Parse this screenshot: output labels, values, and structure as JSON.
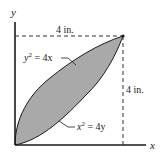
{
  "diagram": {
    "axes": {
      "x_label": "x",
      "y_label": "y"
    },
    "dimensions": {
      "horizontal": "4 in.",
      "vertical": "4 in."
    },
    "curves": {
      "upper": {
        "label_base": "y",
        "label_exp": "2",
        "label_rest": " = 4x",
        "equation": "y^2 = 4x"
      },
      "lower": {
        "label_base": "x",
        "label_exp": "2",
        "label_rest": " = 4y",
        "equation": "x^2 = 4y"
      }
    },
    "region": {
      "description": "Shaded area bounded by y^2 = 4x and x^2 = 4y between (0,0) and (4,4)",
      "fill_color": "#a9a9a9",
      "stroke_color": "#1a1a1a"
    },
    "colors": {
      "axis": "#1a1a1a",
      "dashed": "#333333",
      "background": "#ffffff"
    }
  }
}
